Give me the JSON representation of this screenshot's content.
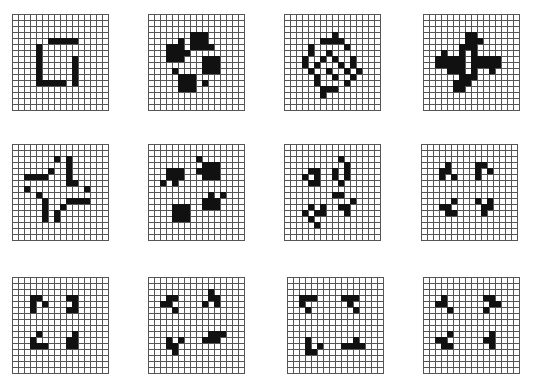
{
  "layout": {
    "rows": 3,
    "cols": 4,
    "grid_size": 16,
    "cell_px": 6
  },
  "colors": {
    "filled": "#111111",
    "empty": "#ffffff",
    "line": "#555555"
  },
  "panels": [
    {
      "id": 1,
      "x": 12,
      "y": 14,
      "cells": [
        [
          4,
          5
        ],
        [
          4,
          6
        ],
        [
          4,
          7
        ],
        [
          4,
          8
        ],
        [
          4,
          9
        ],
        [
          4,
          10
        ],
        [
          4,
          11
        ],
        [
          6,
          4
        ],
        [
          7,
          4
        ],
        [
          8,
          4
        ],
        [
          9,
          4
        ],
        [
          10,
          4
        ],
        [
          10,
          7
        ],
        [
          10,
          8
        ],
        [
          10,
          9
        ],
        [
          10,
          10
        ],
        [
          10,
          11
        ],
        [
          5,
          11
        ],
        [
          6,
          11
        ],
        [
          7,
          11
        ],
        [
          8,
          11
        ]
      ]
    },
    {
      "id": 2,
      "x": 148,
      "y": 14,
      "cells": [
        [
          7,
          3
        ],
        [
          8,
          3
        ],
        [
          9,
          3
        ],
        [
          7,
          4
        ],
        [
          8,
          4
        ],
        [
          9,
          4
        ],
        [
          7,
          5
        ],
        [
          8,
          5
        ],
        [
          9,
          5
        ],
        [
          5,
          4
        ],
        [
          3,
          5
        ],
        [
          4,
          5
        ],
        [
          5,
          5
        ],
        [
          3,
          6
        ],
        [
          4,
          6
        ],
        [
          5,
          6
        ],
        [
          3,
          7
        ],
        [
          4,
          7
        ],
        [
          5,
          7
        ],
        [
          6,
          6
        ],
        [
          10,
          5
        ],
        [
          9,
          7
        ],
        [
          10,
          7
        ],
        [
          11,
          7
        ],
        [
          9,
          8
        ],
        [
          10,
          8
        ],
        [
          11,
          8
        ],
        [
          9,
          9
        ],
        [
          10,
          9
        ],
        [
          11,
          9
        ],
        [
          4,
          9
        ],
        [
          5,
          10
        ],
        [
          6,
          10
        ],
        [
          7,
          10
        ],
        [
          5,
          11
        ],
        [
          6,
          11
        ],
        [
          7,
          11
        ],
        [
          5,
          12
        ],
        [
          6,
          12
        ],
        [
          7,
          12
        ],
        [
          9,
          11
        ]
      ]
    },
    {
      "id": 3,
      "x": 284,
      "y": 14,
      "cells": [
        [
          8,
          3
        ],
        [
          6,
          4
        ],
        [
          7,
          4
        ],
        [
          8,
          4
        ],
        [
          9,
          4
        ],
        [
          4,
          5
        ],
        [
          10,
          5
        ],
        [
          4,
          6
        ],
        [
          7,
          6
        ],
        [
          3,
          7
        ],
        [
          6,
          7
        ],
        [
          8,
          7
        ],
        [
          11,
          7
        ],
        [
          3,
          8
        ],
        [
          5,
          8
        ],
        [
          9,
          8
        ],
        [
          11,
          8
        ],
        [
          4,
          9
        ],
        [
          7,
          9
        ],
        [
          10,
          9
        ],
        [
          12,
          9
        ],
        [
          5,
          10
        ],
        [
          8,
          10
        ],
        [
          11,
          10
        ],
        [
          5,
          11
        ],
        [
          10,
          11
        ],
        [
          6,
          12
        ],
        [
          7,
          12
        ],
        [
          8,
          12
        ],
        [
          6,
          13
        ]
      ]
    },
    {
      "id": 4,
      "x": 423,
      "y": 14,
      "cells": [
        [
          7,
          3
        ],
        [
          8,
          3
        ],
        [
          7,
          4
        ],
        [
          8,
          4
        ],
        [
          9,
          4
        ],
        [
          6,
          5
        ],
        [
          7,
          5
        ],
        [
          8,
          5
        ],
        [
          3,
          6
        ],
        [
          6,
          6
        ],
        [
          8,
          6
        ],
        [
          2,
          7
        ],
        [
          3,
          7
        ],
        [
          4,
          7
        ],
        [
          5,
          7
        ],
        [
          6,
          7
        ],
        [
          8,
          7
        ],
        [
          9,
          7
        ],
        [
          10,
          7
        ],
        [
          11,
          7
        ],
        [
          12,
          7
        ],
        [
          2,
          8
        ],
        [
          3,
          8
        ],
        [
          4,
          8
        ],
        [
          5,
          8
        ],
        [
          6,
          8
        ],
        [
          8,
          8
        ],
        [
          9,
          8
        ],
        [
          10,
          8
        ],
        [
          11,
          8
        ],
        [
          12,
          8
        ],
        [
          4,
          9
        ],
        [
          5,
          9
        ],
        [
          6,
          9
        ],
        [
          8,
          9
        ],
        [
          11,
          9
        ],
        [
          6,
          10
        ],
        [
          7,
          10
        ],
        [
          8,
          10
        ],
        [
          5,
          11
        ],
        [
          6,
          11
        ],
        [
          7,
          11
        ],
        [
          5,
          12
        ],
        [
          6,
          12
        ]
      ]
    },
    {
      "id": 5,
      "x": 12,
      "y": 144,
      "cells": [
        [
          7,
          2
        ],
        [
          9,
          2
        ],
        [
          9,
          3
        ],
        [
          9,
          4
        ],
        [
          6,
          4
        ],
        [
          2,
          5
        ],
        [
          3,
          5
        ],
        [
          4,
          5
        ],
        [
          5,
          5
        ],
        [
          9,
          5
        ],
        [
          9,
          6
        ],
        [
          10,
          6
        ],
        [
          2,
          7
        ],
        [
          12,
          7
        ],
        [
          4,
          8
        ],
        [
          5,
          9
        ],
        [
          9,
          9
        ],
        [
          10,
          9
        ],
        [
          11,
          9
        ],
        [
          12,
          9
        ],
        [
          5,
          10
        ],
        [
          8,
          10
        ],
        [
          5,
          11
        ],
        [
          7,
          11
        ],
        [
          5,
          12
        ],
        [
          7,
          12
        ]
      ]
    },
    {
      "id": 6,
      "x": 148,
      "y": 144,
      "cells": [
        [
          8,
          2
        ],
        [
          9,
          3
        ],
        [
          10,
          3
        ],
        [
          11,
          3
        ],
        [
          3,
          4
        ],
        [
          4,
          4
        ],
        [
          5,
          4
        ],
        [
          8,
          4
        ],
        [
          9,
          4
        ],
        [
          10,
          4
        ],
        [
          11,
          4
        ],
        [
          3,
          5
        ],
        [
          4,
          5
        ],
        [
          5,
          5
        ],
        [
          9,
          5
        ],
        [
          10,
          5
        ],
        [
          11,
          5
        ],
        [
          2,
          6
        ],
        [
          4,
          6
        ],
        [
          10,
          8
        ],
        [
          12,
          8
        ],
        [
          9,
          9
        ],
        [
          10,
          9
        ],
        [
          11,
          9
        ],
        [
          4,
          10
        ],
        [
          5,
          10
        ],
        [
          6,
          10
        ],
        [
          9,
          10
        ],
        [
          10,
          10
        ],
        [
          11,
          10
        ],
        [
          4,
          11
        ],
        [
          5,
          11
        ],
        [
          6,
          11
        ],
        [
          4,
          12
        ],
        [
          5,
          12
        ],
        [
          6,
          12
        ]
      ]
    },
    {
      "id": 7,
      "x": 284,
      "y": 144,
      "cells": [
        [
          9,
          2
        ],
        [
          10,
          3
        ],
        [
          4,
          4
        ],
        [
          5,
          4
        ],
        [
          8,
          4
        ],
        [
          10,
          4
        ],
        [
          3,
          5
        ],
        [
          5,
          5
        ],
        [
          8,
          5
        ],
        [
          10,
          5
        ],
        [
          4,
          6
        ],
        [
          5,
          6
        ],
        [
          9,
          6
        ],
        [
          8,
          8
        ],
        [
          9,
          8
        ],
        [
          11,
          9
        ],
        [
          4,
          10
        ],
        [
          6,
          10
        ],
        [
          9,
          10
        ],
        [
          10,
          10
        ],
        [
          3,
          11
        ],
        [
          5,
          11
        ],
        [
          6,
          11
        ],
        [
          10,
          11
        ],
        [
          4,
          12
        ],
        [
          5,
          13
        ]
      ]
    },
    {
      "id": 8,
      "x": 421,
      "y": 144,
      "cells": [
        [
          4,
          3
        ],
        [
          3,
          4
        ],
        [
          4,
          4
        ],
        [
          9,
          3
        ],
        [
          10,
          3
        ],
        [
          9,
          4
        ],
        [
          11,
          4
        ],
        [
          3,
          5
        ],
        [
          5,
          5
        ],
        [
          9,
          5
        ],
        [
          5,
          9
        ],
        [
          3,
          10
        ],
        [
          4,
          10
        ],
        [
          4,
          11
        ],
        [
          5,
          11
        ],
        [
          9,
          9
        ],
        [
          11,
          9
        ],
        [
          10,
          10
        ],
        [
          11,
          10
        ],
        [
          10,
          11
        ]
      ]
    },
    {
      "id": 9,
      "x": 12,
      "y": 277,
      "cells": [
        [
          3,
          3
        ],
        [
          4,
          3
        ],
        [
          3,
          4
        ],
        [
          5,
          4
        ],
        [
          3,
          5
        ],
        [
          9,
          3
        ],
        [
          10,
          3
        ],
        [
          10,
          4
        ],
        [
          9,
          5
        ],
        [
          10,
          5
        ],
        [
          4,
          9
        ],
        [
          3,
          10
        ],
        [
          3,
          11
        ],
        [
          4,
          11
        ],
        [
          5,
          11
        ],
        [
          10,
          9
        ],
        [
          9,
          10
        ],
        [
          10,
          10
        ],
        [
          9,
          11
        ],
        [
          10,
          11
        ]
      ]
    },
    {
      "id": 10,
      "x": 148,
      "y": 277,
      "cells": [
        [
          3,
          3
        ],
        [
          4,
          3
        ],
        [
          2,
          4
        ],
        [
          3,
          4
        ],
        [
          4,
          5
        ],
        [
          10,
          2
        ],
        [
          10,
          3
        ],
        [
          11,
          3
        ],
        [
          9,
          4
        ],
        [
          11,
          4
        ],
        [
          3,
          10
        ],
        [
          5,
          10
        ],
        [
          3,
          11
        ],
        [
          4,
          11
        ],
        [
          4,
          12
        ],
        [
          10,
          9
        ],
        [
          11,
          9
        ],
        [
          12,
          9
        ],
        [
          9,
          10
        ],
        [
          10,
          10
        ],
        [
          11,
          10
        ]
      ]
    },
    {
      "id": 11,
      "x": 287,
      "y": 277,
      "cells": [
        [
          2,
          3
        ],
        [
          3,
          3
        ],
        [
          4,
          3
        ],
        [
          2,
          4
        ],
        [
          3,
          5
        ],
        [
          9,
          3
        ],
        [
          10,
          3
        ],
        [
          11,
          3
        ],
        [
          10,
          4
        ],
        [
          11,
          5
        ],
        [
          3,
          10
        ],
        [
          3,
          11
        ],
        [
          5,
          11
        ],
        [
          3,
          12
        ],
        [
          4,
          12
        ],
        [
          11,
          10
        ],
        [
          10,
          11
        ],
        [
          11,
          11
        ],
        [
          12,
          11
        ],
        [
          9,
          11
        ]
      ]
    },
    {
      "id": 12,
      "x": 423,
      "y": 277,
      "cells": [
        [
          3,
          3
        ],
        [
          2,
          4
        ],
        [
          3,
          4
        ],
        [
          4,
          5
        ],
        [
          10,
          3
        ],
        [
          11,
          3
        ],
        [
          11,
          4
        ],
        [
          12,
          4
        ],
        [
          10,
          5
        ],
        [
          4,
          9
        ],
        [
          2,
          10
        ],
        [
          3,
          10
        ],
        [
          3,
          11
        ],
        [
          4,
          11
        ],
        [
          11,
          9
        ],
        [
          10,
          10
        ],
        [
          11,
          10
        ],
        [
          11,
          11
        ]
      ]
    }
  ]
}
